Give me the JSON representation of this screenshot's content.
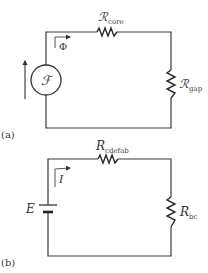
{
  "diagram_a": {
    "panel_label": "(a)",
    "top_resistor": {
      "symbol": "ℛ",
      "subscript": "core"
    },
    "right_resistor": {
      "symbol": "ℛ",
      "subscript": "gap"
    },
    "source_symbol": "ℱ",
    "flux_label": "Φ"
  },
  "diagram_b": {
    "panel_label": "(b)",
    "top_resistor": {
      "symbol": "R",
      "subscript": "cdefab"
    },
    "right_resistor": {
      "symbol": "R",
      "subscript": "bc"
    },
    "source_label": "E",
    "current_label": "I"
  }
}
